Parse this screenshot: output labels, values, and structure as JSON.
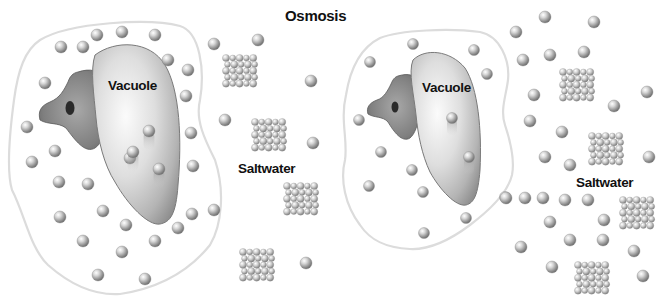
{
  "title": "Osmosis",
  "colors": {
    "membrane": "#dcdcdc",
    "vacuole_light": "#f2f2f2",
    "vacuole_dark": "#9a9a9a",
    "nucleus_body": "#8a8a8a",
    "nucleolus": "#2a2a2a",
    "molecule": "#bdbdbd",
    "text": "#111111"
  },
  "panels": [
    {
      "id": "before",
      "vacuole_label": "Vacuole",
      "surroundings_label": "Saltwater",
      "cell_water_molecules": 34,
      "vacuole_water_molecules": 3,
      "outside_water_molecules": 7,
      "salt_crystals": 4
    },
    {
      "id": "after",
      "vacuole_label": "Vacuole",
      "surroundings_label": "Saltwater",
      "cell_water_molecules": 12,
      "vacuole_water_molecules": 2,
      "outside_water_molecules": 28,
      "salt_crystals": 5
    }
  ]
}
